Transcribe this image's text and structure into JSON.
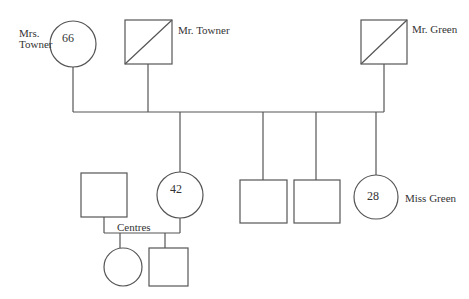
{
  "diagram": {
    "type": "pedigree chart",
    "people": [
      {
        "id": "mrs-towner",
        "label_line1": "Mrs.",
        "label_line2": "Towner",
        "sex": "female",
        "age": "66",
        "deceased": false
      },
      {
        "id": "mr-towner",
        "label": "Mr. Towner",
        "sex": "male",
        "deceased": true
      },
      {
        "id": "mr-green",
        "label": "Mr. Green",
        "sex": "male",
        "deceased": true
      },
      {
        "id": "centres-husband",
        "sex": "male",
        "age": ""
      },
      {
        "id": "mrs-centres",
        "sex": "female",
        "age": "42"
      },
      {
        "id": "son-1",
        "sex": "male"
      },
      {
        "id": "son-2",
        "sex": "male"
      },
      {
        "id": "miss-green",
        "label": "Miss Green",
        "sex": "female",
        "age": "28"
      },
      {
        "id": "grandchild-daughter",
        "sex": "female"
      },
      {
        "id": "grandchild-son",
        "sex": "male"
      }
    ],
    "family_label": "Centres"
  }
}
